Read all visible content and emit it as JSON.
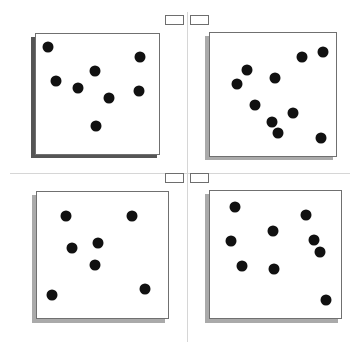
{
  "layout": {
    "colors": {
      "background": "#ffffff",
      "panel_border": "#707070",
      "dot": "#111111",
      "divider": "#d6d6d6",
      "button_border": "#6e6e6e"
    }
  },
  "top_buttons": [
    {
      "x": 165,
      "y": 15
    },
    {
      "x": 190,
      "y": 15
    }
  ],
  "middle_buttons": [
    {
      "x": 165,
      "y": 173
    },
    {
      "x": 190,
      "y": 173
    }
  ],
  "panels": [
    {
      "id": "top-left",
      "box": {
        "x": 35,
        "y": 33,
        "w": 125,
        "h": 122
      },
      "shadow": {
        "x": 31,
        "y": 37,
        "w": 126,
        "h": 121,
        "color": "#555555"
      },
      "dots": [
        [
          48,
          47
        ],
        [
          140,
          57
        ],
        [
          56,
          81
        ],
        [
          78,
          88
        ],
        [
          95,
          71
        ],
        [
          109,
          98
        ],
        [
          139,
          91
        ],
        [
          96,
          126
        ]
      ]
    },
    {
      "id": "top-right",
      "box": {
        "x": 209,
        "y": 32,
        "w": 128,
        "h": 125
      },
      "shadow": {
        "x": 205,
        "y": 36,
        "w": 128,
        "h": 124,
        "color": "#aaaaaa"
      },
      "dots": [
        [
          323,
          52
        ],
        [
          302,
          57
        ],
        [
          247,
          70
        ],
        [
          275,
          78
        ],
        [
          237,
          84
        ],
        [
          255,
          105
        ],
        [
          293,
          113
        ],
        [
          272,
          122
        ],
        [
          278,
          133
        ],
        [
          321,
          138
        ]
      ]
    },
    {
      "id": "bottom-left",
      "box": {
        "x": 36,
        "y": 191,
        "w": 133,
        "h": 128
      },
      "shadow": {
        "x": 32,
        "y": 195,
        "w": 133,
        "h": 128,
        "color": "#aaaaaa"
      },
      "dots": [
        [
          66,
          216
        ],
        [
          132,
          216
        ],
        [
          72,
          248
        ],
        [
          98,
          243
        ],
        [
          95,
          265
        ],
        [
          52,
          295
        ],
        [
          145,
          289
        ]
      ]
    },
    {
      "id": "bottom-right",
      "box": {
        "x": 209,
        "y": 190,
        "w": 133,
        "h": 129
      },
      "shadow": {
        "x": 205,
        "y": 194,
        "w": 133,
        "h": 129,
        "color": "#aaaaaa"
      },
      "dots": [
        [
          235,
          207
        ],
        [
          306,
          215
        ],
        [
          273,
          231
        ],
        [
          231,
          241
        ],
        [
          314,
          240
        ],
        [
          320,
          252
        ],
        [
          242,
          266
        ],
        [
          274,
          269
        ],
        [
          326,
          300
        ]
      ]
    }
  ]
}
